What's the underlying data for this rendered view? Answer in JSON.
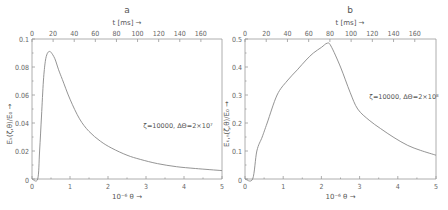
{
  "chart_data": [
    {
      "type": "line",
      "panel": "a",
      "title": "a",
      "xlabel": "10⁻⁶ θ →",
      "ylabel": "Eₖ(ζ,θ)/E₀ →",
      "top_xlabel": "t [ms] →",
      "xlim": [
        0,
        5
      ],
      "ylim": [
        0,
        0.1
      ],
      "top_xlim": [
        0,
        180
      ],
      "xticks": [
        "0",
        "1",
        "2",
        "3",
        "4",
        "5"
      ],
      "xtick_values": [
        0,
        1,
        2,
        3,
        4,
        5
      ],
      "yticks": [
        "0",
        "0.02",
        "0.04",
        "0.06",
        "0.08",
        "0.1"
      ],
      "ytick_values": [
        0,
        0.02,
        0.04,
        0.06,
        0.08,
        0.1
      ],
      "top_xticks": [
        "0",
        "20",
        "40",
        "60",
        "80",
        "100",
        "120",
        "140",
        "160"
      ],
      "top_xtick_values": [
        0,
        20,
        40,
        60,
        80,
        100,
        120,
        140,
        160
      ],
      "annotation": "ζ=10000,  ΔΘ=2×10⁷",
      "grid": false,
      "series": [
        {
          "name": "energy",
          "x": [
            0,
            0.15,
            0.2,
            0.25,
            0.3,
            0.35,
            0.4,
            0.45,
            0.5,
            0.6,
            0.7,
            0.8,
            1.0,
            1.25,
            1.5,
            1.8,
            2.1,
            2.5,
            2.85,
            3.3,
            3.8,
            4.3,
            5.0
          ],
          "y": [
            0,
            0,
            0.02,
            0.045,
            0.07,
            0.084,
            0.0895,
            0.091,
            0.0905,
            0.086,
            0.078,
            0.071,
            0.057,
            0.043,
            0.034,
            0.027,
            0.022,
            0.017,
            0.014,
            0.011,
            0.0088,
            0.0075,
            0.006
          ]
        }
      ]
    },
    {
      "type": "line",
      "panel": "b",
      "title": "b",
      "xlabel": "10⁻⁶ θ →",
      "ylabel": "Eₖ,ₙ(ζ,θ)/E₀ →",
      "top_xlabel": "t [ms] →",
      "xlim": [
        0,
        5
      ],
      "ylim": [
        0,
        0.5
      ],
      "top_xlim": [
        0,
        180
      ],
      "xticks": [
        "0",
        "1",
        "2",
        "3",
        "4",
        "5"
      ],
      "xtick_values": [
        0,
        1,
        2,
        3,
        4,
        5
      ],
      "yticks": [
        "0",
        "0.1",
        "0.2",
        "0.3",
        "0.4",
        "0.5"
      ],
      "ytick_values": [
        0,
        0.1,
        0.2,
        0.3,
        0.4,
        0.5
      ],
      "top_xticks": [
        "0",
        "20",
        "40",
        "60",
        "80",
        "100",
        "120",
        "140",
        "160"
      ],
      "top_xtick_values": [
        0,
        20,
        40,
        60,
        80,
        100,
        120,
        140,
        160
      ],
      "annotation": "ζ=10000,  ΔΘ=2×10⁸",
      "grid": false,
      "series": [
        {
          "name": "energy",
          "x": [
            0,
            0.2,
            0.31,
            0.45,
            0.58,
            0.84,
            1.1,
            1.37,
            1.6,
            1.79,
            2.0,
            2.15,
            2.25,
            2.5,
            2.75,
            2.95,
            3.25,
            3.55,
            3.9,
            4.26,
            4.6,
            5.0
          ],
          "y": [
            0,
            0,
            0.1,
            0.15,
            0.2,
            0.3,
            0.35,
            0.39,
            0.425,
            0.45,
            0.47,
            0.485,
            0.475,
            0.4,
            0.31,
            0.25,
            0.21,
            0.18,
            0.148,
            0.12,
            0.102,
            0.085
          ]
        }
      ]
    }
  ]
}
